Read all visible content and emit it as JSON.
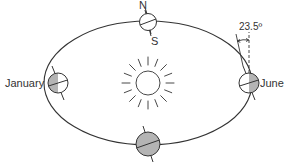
{
  "diagram": {
    "labels": {
      "north": "N",
      "south": "S",
      "january": "January",
      "june": "June",
      "tilt_angle": "23.5º"
    },
    "colors": {
      "line": "#333333",
      "shade": "#b4b4b4",
      "background": "#ffffff"
    },
    "positions": [
      {
        "name": "top",
        "shading": "none"
      },
      {
        "name": "January",
        "shading": "left-half"
      },
      {
        "name": "June",
        "shading": "right-half"
      },
      {
        "name": "bottom",
        "shading": "full"
      }
    ],
    "tilt_degrees": 23.5
  }
}
